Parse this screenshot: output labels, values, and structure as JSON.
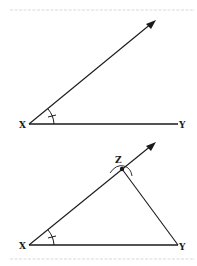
{
  "diagram": {
    "colors": {
      "stroke": "#1a1a1a",
      "faint": "#c8c8c8",
      "background": "#ffffff"
    },
    "top_figure": {
      "labels": {
        "vertex": "X",
        "end": "Y"
      },
      "description": "Angle at X with ray extending up-right and base segment XY; arc with tick marks the angle"
    },
    "bottom_figure": {
      "labels": {
        "vertex": "X",
        "end": "Y",
        "apex": "Z"
      },
      "description": "Triangle XYZ formed by ray from X intersected at Z by arc from Y; angle at X marked"
    }
  }
}
